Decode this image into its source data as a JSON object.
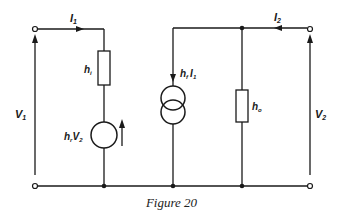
{
  "figure": {
    "caption": "Figure 20"
  },
  "labels": {
    "i1": "I",
    "i1_sub": "1",
    "i2": "I",
    "i2_sub": "2",
    "v1": "V",
    "v1_sub": "1",
    "v2": "V",
    "v2_sub": "2",
    "hi": "h",
    "hi_sub": "i",
    "ho": "h",
    "ho_sub": "o",
    "hr_v2": "h",
    "hr_v2_sub": "r",
    "hr_v2_tail": "V",
    "hr_v2_tail_sub": "2",
    "hf_i1": "h",
    "hf_i1_sub": "f",
    "hf_i1_tail": "I",
    "hf_i1_tail_sub": "1"
  },
  "components": [
    {
      "id": "hi",
      "type": "resistor",
      "label": "h_i"
    },
    {
      "id": "hrV2",
      "type": "voltage-source",
      "label": "h_r V_2"
    },
    {
      "id": "hfI1",
      "type": "current-source",
      "label": "h_f I_1"
    },
    {
      "id": "ho",
      "type": "resistor",
      "label": "h_o"
    }
  ],
  "colors": {
    "line": "#1a1a1a",
    "background": "#ffffff"
  }
}
